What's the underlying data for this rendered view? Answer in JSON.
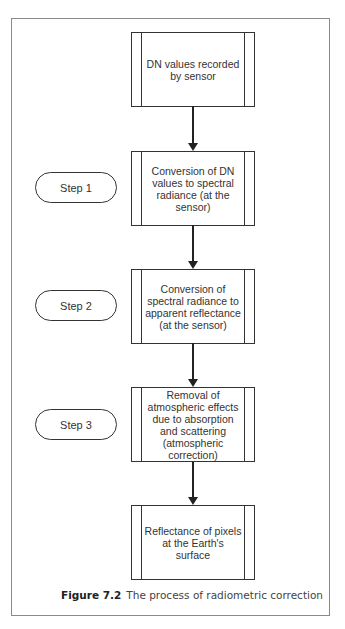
{
  "figure": {
    "caption_label": "Figure 7.2",
    "caption_text": "The process of radiometric correction"
  },
  "flow": {
    "boxes": [
      {
        "label": "DN values recorded by sensor"
      },
      {
        "label": "Conversion of DN values to spectral radiance (at the sensor)"
      },
      {
        "label": "Conversion of spectral radiance to apparent reflectance (at the sensor)"
      },
      {
        "label": "Removal of atmospheric effects due to absorption and scattering (atmospheric correction)"
      },
      {
        "label": "Reflectance of pixels at the Earth's surface"
      }
    ],
    "steps": [
      {
        "label": "Step 1"
      },
      {
        "label": "Step 2"
      },
      {
        "label": "Step 3"
      }
    ]
  },
  "colors": {
    "line": "#333333",
    "frame": "#8a8a8a",
    "background": "#ffffff"
  }
}
